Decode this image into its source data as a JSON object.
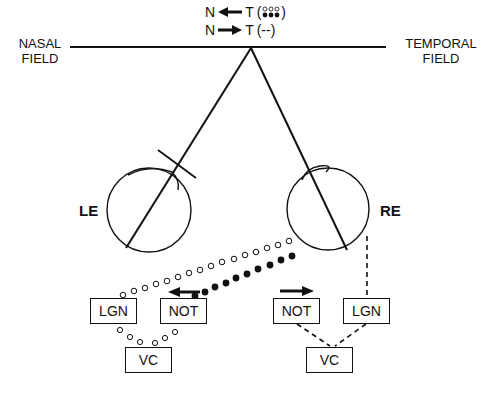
{
  "legend": {
    "row1": {
      "left": "N",
      "arrow": "left",
      "right": "T",
      "symbol": "(open & filled dots)"
    },
    "row2": {
      "left": "N",
      "arrow": "right",
      "right": "T",
      "symbol": "(--)"
    }
  },
  "fields": {
    "nasal_line1": "NASAL",
    "nasal_line2": "FIELD",
    "temporal_line1": "TEMPORAL",
    "temporal_line2": "FIELD"
  },
  "eyes": {
    "left": "LE",
    "right": "RE"
  },
  "boxes": {
    "lgn_left": "LGN",
    "not_left": "NOT",
    "vc_left": "VC",
    "not_right": "NOT",
    "lgn_right": "LGN",
    "vc_right": "VC"
  },
  "colors": {
    "ink": "#111111",
    "background": "#ffffff"
  }
}
